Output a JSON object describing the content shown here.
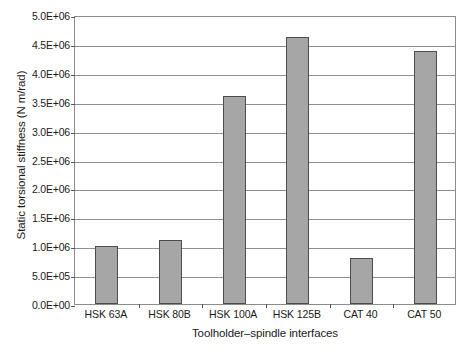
{
  "chart_data": {
    "type": "bar",
    "title": "",
    "categories": [
      "HSK 63A",
      "HSK 80B",
      "HSK 100A",
      "HSK 125B",
      "CAT 40",
      "CAT 50"
    ],
    "values": [
      1000000,
      1100000,
      3600000,
      4620000,
      790000,
      4380000
    ],
    "value_labels": [
      "1.0E+06",
      "1.1E+06",
      "3.6E+06",
      "4.62E+06",
      "7.9E+05",
      "4.38E+06"
    ],
    "xlabel": "Toolholder–spindle interfaces",
    "ylabel": "Static torsional stiffness (N m/rad)",
    "ylim": [
      0,
      5000000
    ],
    "ytick_values": [
      0,
      500000,
      1000000,
      1500000,
      2000000,
      2500000,
      3000000,
      3500000,
      4000000,
      4500000,
      5000000
    ],
    "ytick_labels": [
      "0.0E+00",
      "5.0E+05",
      "1.0E+06",
      "1.5E+06",
      "2.0E+06",
      "2.5E+06",
      "3.0E+06",
      "3.5E+06",
      "4.0E+06",
      "4.5E+06",
      "5.0E+06"
    ],
    "grid": true,
    "legend": false,
    "legend_position": "none",
    "bar_fill_color": "#a6a6a6",
    "bar_border_color": "#4d4d4d",
    "grid_color": "#8f8f8f",
    "axis_color": "#8c8c8c",
    "text_color": "#1a1a1a",
    "background_color": "#ffffff"
  }
}
